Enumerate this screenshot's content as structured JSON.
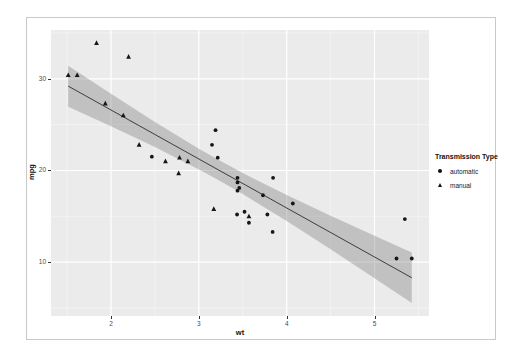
{
  "figure": {
    "background": "#ffffff",
    "border_color": "#c9c9c9"
  },
  "chart_data": {
    "type": "scatter",
    "title": "",
    "xlabel": "wt",
    "ylabel": "mpg",
    "xlim": [
      1.317,
      5.62
    ],
    "ylim": [
      4.13,
      35.32
    ],
    "x_ticks": [
      2,
      3,
      4,
      5
    ],
    "y_ticks": [
      10,
      20,
      30
    ],
    "x_minor_ticks": [
      1.5,
      2.5,
      3.5,
      4.5,
      5.5
    ],
    "y_minor_ticks": [
      5,
      15,
      25,
      35
    ],
    "grid": "on",
    "panel_bg": "#ebebeb",
    "grid_major_color": "#ffffff",
    "grid_minor_color": "rgba(255,255,255,0.5)",
    "point_color": "#161616",
    "smooth_line_color": "#3d3d3d",
    "ribbon_color": "rgba(125,125,125,0.38)",
    "legend": {
      "title": "Transmission Type",
      "position": "right",
      "entries": [
        {
          "label": "automatic",
          "shape": "circle"
        },
        {
          "label": "manual",
          "shape": "triangle"
        }
      ]
    },
    "series": [
      {
        "name": "automatic",
        "shape": "circle",
        "points": [
          [
            3.215,
            21.4
          ],
          [
            3.44,
            18.7
          ],
          [
            3.46,
            18.1
          ],
          [
            3.57,
            14.3
          ],
          [
            3.19,
            24.4
          ],
          [
            3.15,
            22.8
          ],
          [
            3.44,
            19.2
          ],
          [
            3.44,
            17.8
          ],
          [
            4.07,
            16.4
          ],
          [
            3.73,
            17.3
          ],
          [
            3.78,
            15.2
          ],
          [
            5.25,
            10.4
          ],
          [
            5.424,
            10.4
          ],
          [
            5.345,
            14.7
          ],
          [
            2.465,
            21.5
          ],
          [
            3.52,
            15.5
          ],
          [
            3.435,
            15.2
          ],
          [
            3.84,
            13.3
          ],
          [
            3.845,
            19.2
          ]
        ]
      },
      {
        "name": "manual",
        "shape": "triangle",
        "points": [
          [
            2.62,
            21.0
          ],
          [
            2.875,
            21.0
          ],
          [
            2.32,
            22.8
          ],
          [
            2.2,
            32.4
          ],
          [
            1.615,
            30.4
          ],
          [
            1.835,
            33.9
          ],
          [
            1.935,
            27.3
          ],
          [
            2.14,
            26.0
          ],
          [
            1.513,
            30.4
          ],
          [
            3.17,
            15.8
          ],
          [
            2.77,
            19.7
          ],
          [
            3.57,
            15.0
          ],
          [
            2.78,
            21.4
          ]
        ]
      }
    ],
    "smooth": {
      "method": "linear",
      "line": [
        [
          1.513,
          29.2
        ],
        [
          5.424,
          8.3
        ]
      ],
      "ribbon": [
        {
          "x": 1.513,
          "lo": 26.96,
          "hi": 31.43
        },
        {
          "x": 2.0,
          "lo": 24.82,
          "hi": 28.37
        },
        {
          "x": 2.5,
          "lo": 22.55,
          "hi": 25.29
        },
        {
          "x": 3.0,
          "lo": 20.12,
          "hi": 22.38
        },
        {
          "x": 3.217,
          "lo": 18.99,
          "hi": 21.19
        },
        {
          "x": 3.5,
          "lo": 17.43,
          "hi": 19.72
        },
        {
          "x": 4.0,
          "lo": 14.49,
          "hi": 17.32
        },
        {
          "x": 4.5,
          "lo": 11.41,
          "hi": 15.07
        },
        {
          "x": 5.0,
          "lo": 8.25,
          "hi": 12.88
        },
        {
          "x": 5.424,
          "lo": 5.55,
          "hi": 11.05
        }
      ]
    }
  }
}
